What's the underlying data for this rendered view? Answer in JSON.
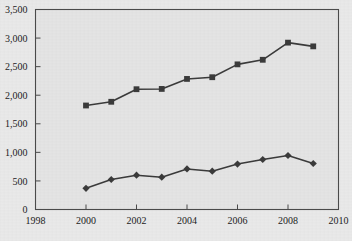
{
  "chart_data": {
    "type": "line",
    "title": "",
    "subtitle": "",
    "xlabel": "",
    "ylabel": "",
    "x": [
      2000,
      2001,
      2002,
      2003,
      2004,
      2005,
      2006,
      2007,
      2008,
      2009
    ],
    "series": [
      {
        "name": "upper-series",
        "marker": "square",
        "color": "#3a3a3a",
        "values": [
          1820,
          1885,
          2105,
          2110,
          2285,
          2315,
          2540,
          2620,
          2920,
          2855
        ]
      },
      {
        "name": "lower-series",
        "marker": "diamond",
        "color": "#3a3a3a",
        "values": [
          370,
          525,
          600,
          565,
          710,
          670,
          795,
          875,
          945,
          805
        ]
      }
    ],
    "xlim": [
      1998,
      2010
    ],
    "ylim": [
      0,
      3500
    ],
    "ytick_values": [
      0,
      500,
      1000,
      1500,
      2000,
      2500,
      3000,
      3500
    ],
    "ytick_labels": [
      "0",
      "500",
      "1,000",
      "1,500",
      "2,000",
      "2,500",
      "3,000",
      "3,500"
    ],
    "xtick_values": [
      1998,
      2000,
      2002,
      2004,
      2006,
      2008,
      2010
    ],
    "xtick_labels": [
      "1998",
      "2000",
      "2002",
      "2004",
      "2006",
      "2008",
      "2010"
    ],
    "grid": false,
    "legend": "none",
    "plot_background": "#e4e4e4",
    "page_background": "#e9e9e9",
    "axis_color": "#4a4a4a",
    "line_color": "#3a3a3a"
  }
}
